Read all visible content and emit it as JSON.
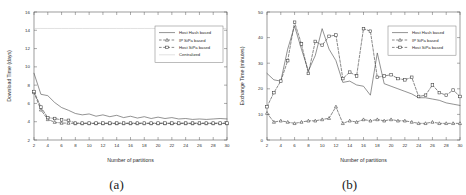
{
  "figure": {
    "panels": [
      {
        "caption": "(a)",
        "name": "download-time-chart"
      },
      {
        "caption": "(b)",
        "name": "exchange-time-chart"
      }
    ]
  },
  "chart_data": [
    {
      "type": "line",
      "title": "",
      "xlabel": "Number of partitions",
      "ylabel": "Download Time (days)",
      "xlim": [
        2,
        30
      ],
      "ylim": [
        2,
        16
      ],
      "xticks": [
        2,
        4,
        6,
        8,
        10,
        12,
        14,
        16,
        18,
        20,
        22,
        24,
        26,
        28,
        30
      ],
      "yticks": [
        2,
        4,
        6,
        8,
        10,
        12,
        14,
        16
      ],
      "grid": false,
      "legend_position": "upper-right",
      "x": [
        2,
        3,
        4,
        5,
        6,
        7,
        8,
        9,
        10,
        11,
        12,
        13,
        14,
        15,
        16,
        17,
        18,
        19,
        20,
        21,
        22,
        23,
        24,
        25,
        26,
        27,
        28,
        29,
        30
      ],
      "series": [
        {
          "name": "Host Hash based",
          "style": "solid",
          "marker": "none",
          "color": "#4a4a4a",
          "values": [
            9.3,
            7.0,
            6.85,
            6.1,
            5.55,
            5.25,
            4.9,
            4.75,
            4.85,
            4.6,
            4.75,
            4.55,
            4.7,
            4.45,
            4.6,
            4.4,
            4.55,
            4.35,
            4.5,
            4.35,
            4.45,
            4.3,
            4.35,
            4.25,
            4.3,
            4.25,
            4.3,
            4.35,
            4.3
          ]
        },
        {
          "name": "IP SiPa based",
          "style": "dashed",
          "marker": "triangle",
          "color": "#3a3a3a",
          "values": [
            7.2,
            5.3,
            4.25,
            3.95,
            3.85,
            3.85,
            3.8,
            3.8,
            3.8,
            3.8,
            3.8,
            3.8,
            3.8,
            3.8,
            3.8,
            3.8,
            3.8,
            3.8,
            3.8,
            3.8,
            3.8,
            3.8,
            3.8,
            3.8,
            3.8,
            3.8,
            3.8,
            3.8,
            3.8
          ]
        },
        {
          "name": "Host SiPa based",
          "style": "dashed",
          "marker": "square",
          "color": "#3a3a3a",
          "values": [
            7.3,
            5.6,
            4.45,
            4.35,
            4.2,
            4.15,
            3.85,
            3.85,
            3.85,
            3.85,
            3.85,
            3.85,
            3.85,
            3.85,
            3.85,
            3.85,
            3.85,
            3.85,
            3.85,
            3.85,
            3.85,
            3.85,
            3.85,
            3.85,
            3.85,
            3.85,
            3.85,
            3.85,
            3.85
          ]
        },
        {
          "name": "Centralized",
          "style": "solid-light",
          "marker": "none",
          "color": "#c8c8c8",
          "values": [
            14.2,
            14.2,
            14.2,
            14.2,
            14.2,
            14.2,
            14.2,
            14.2,
            14.2,
            14.2,
            14.2,
            14.2,
            14.2,
            14.2,
            14.2,
            14.2,
            14.2,
            14.2,
            14.2,
            14.2,
            14.2,
            14.2,
            14.2,
            14.2,
            14.2,
            14.2,
            14.2,
            14.2,
            14.2
          ]
        }
      ]
    },
    {
      "type": "line",
      "title": "",
      "xlabel": "Number of partitions",
      "ylabel": "Exchange Time (minutes)",
      "xlim": [
        2,
        30
      ],
      "ylim": [
        0,
        50
      ],
      "xticks": [
        2,
        4,
        6,
        8,
        10,
        12,
        14,
        16,
        18,
        20,
        22,
        24,
        26,
        28,
        30
      ],
      "yticks": [
        0,
        10,
        20,
        30,
        40,
        50
      ],
      "grid": false,
      "legend_position": "upper-right",
      "x": [
        2,
        3,
        4,
        5,
        6,
        7,
        8,
        9,
        10,
        11,
        12,
        13,
        14,
        15,
        16,
        17,
        18,
        19,
        20,
        21,
        22,
        23,
        24,
        25,
        26,
        27,
        28,
        29,
        30
      ],
      "series": [
        {
          "name": "Host Hash based",
          "style": "solid",
          "marker": "none",
          "color": "#4a4a4a",
          "values": [
            26.0,
            23.5,
            23.0,
            35.5,
            44.5,
            35.5,
            27.0,
            33.0,
            43.5,
            35.5,
            31.0,
            22.5,
            23.0,
            21.5,
            21.0,
            17.5,
            34.0,
            22.0,
            21.0,
            20.0,
            19.0,
            18.0,
            16.5,
            16.5,
            16.0,
            15.5,
            14.5,
            14.0,
            13.5
          ]
        },
        {
          "name": "IP SiPa based",
          "style": "dashed",
          "marker": "triangle",
          "color": "#3a3a3a",
          "values": [
            10.5,
            7.0,
            7.5,
            7.0,
            6.5,
            7.0,
            7.5,
            7.5,
            8.0,
            8.5,
            13.0,
            6.5,
            7.5,
            7.0,
            8.0,
            7.5,
            8.0,
            7.5,
            8.0,
            7.5,
            7.5,
            7.0,
            6.5,
            6.5,
            7.0,
            6.5,
            6.5,
            6.5,
            6.5
          ]
        },
        {
          "name": "Host SiPa based",
          "style": "dashed",
          "marker": "square",
          "color": "#3a3a3a",
          "values": [
            13.0,
            18.5,
            23.0,
            31.0,
            46.0,
            37.5,
            26.0,
            38.5,
            37.0,
            40.5,
            41.0,
            24.0,
            26.5,
            25.0,
            43.5,
            42.5,
            24.5,
            25.0,
            25.5,
            24.0,
            23.5,
            24.5,
            17.0,
            17.5,
            21.5,
            18.5,
            17.5,
            19.5,
            17.0
          ]
        }
      ]
    }
  ]
}
